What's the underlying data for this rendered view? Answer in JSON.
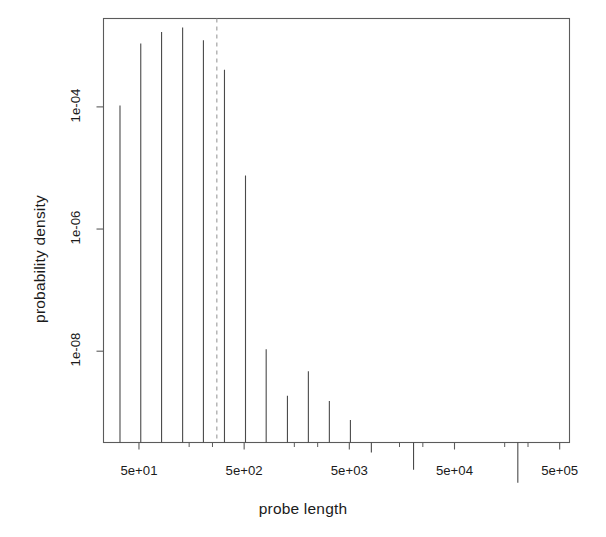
{
  "figure": {
    "background_color": "#ffffff",
    "foreground_color": "#1b1b1b",
    "width": 606,
    "height": 537
  },
  "chart_data": {
    "type": "bar",
    "title": "",
    "subtitle": "",
    "xlabel": "probe length",
    "ylabel": "probability density",
    "xscale": "log",
    "yscale": "log",
    "grid": false,
    "legend": null,
    "legend_position": "none",
    "xlim": [
      23,
      620000
    ],
    "ylim": [
      3.2e-10,
      0.0028
    ],
    "xtick_labels": [
      "5e+01",
      "5e+02",
      "5e+03",
      "5e+04",
      "5e+05"
    ],
    "xtick_values": [
      50,
      500,
      5000,
      50000,
      500000
    ],
    "ytick_labels": [
      "1e-04",
      "1e-06",
      "1e-08"
    ],
    "ytick_values": [
      0.0001,
      1e-06,
      1e-08
    ],
    "minor_xticks": [
      150,
      250,
      1500,
      2500,
      15000,
      25000,
      150000,
      250000
    ],
    "x": [
      33,
      52,
      82,
      130,
      205,
      325,
      515,
      810,
      1290,
      2040,
      3230,
      5120,
      8100,
      20400,
      200000
    ],
    "values": [
      0.000105,
      0.00109,
      0.00168,
      0.002,
      0.00123,
      0.000405,
      7.5e-06,
      1.08e-08,
      1.86e-09,
      4.7e-09,
      1.53e-09,
      7.5e-10,
      2.2e-10,
      1.15e-10,
      7e-11
    ],
    "categories": [
      "33",
      "52",
      "82",
      "130",
      "205",
      "325",
      "515",
      "810",
      "1290",
      "2040",
      "3230",
      "5120",
      "8100",
      "20400",
      "200000"
    ],
    "annotations": [
      {
        "name": "reference-line",
        "type": "vline",
        "x": 275,
        "style": "dashed",
        "color": "#9a9a9a"
      }
    ],
    "series": [
      {
        "name": "probe length density",
        "values": [
          0.000105,
          0.00109,
          0.00168,
          0.002,
          0.00123,
          0.000405,
          7.5e-06,
          1.08e-08,
          1.86e-09,
          4.7e-09,
          1.53e-09,
          7.5e-10,
          2.2e-10,
          1.15e-10,
          7e-11
        ]
      }
    ]
  },
  "labels": {
    "xaxis_title": "probe length",
    "yaxis_title": "probability density",
    "xticks": [
      "5e+01",
      "5e+02",
      "5e+03",
      "5e+04",
      "5e+05"
    ],
    "yticks": [
      "1e-04",
      "1e-06",
      "1e-08"
    ]
  }
}
